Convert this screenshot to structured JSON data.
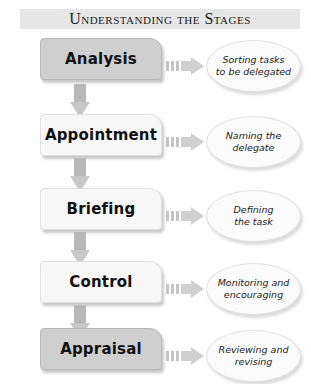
{
  "title": "Understanding the Stages",
  "colors": {
    "title_bg": "#e6e6e6",
    "stage_dark": "#cfcfcf",
    "stage_light": "#f7f7f7",
    "arrow": "#c8c8c8",
    "bubble": "#fbfbfb"
  },
  "stages": [
    {
      "label": "Analysis",
      "description": "Sorting tasks\nto be delegated",
      "style": "dark"
    },
    {
      "label": "Appointment",
      "description": "Naming the\ndelegate",
      "style": "light"
    },
    {
      "label": "Briefing",
      "description": "Defining\nthe task",
      "style": "light"
    },
    {
      "label": "Control",
      "description": "Monitoring and\nencouraging",
      "style": "light"
    },
    {
      "label": "Appraisal",
      "description": "Reviewing and\nrevising",
      "style": "dark"
    }
  ]
}
